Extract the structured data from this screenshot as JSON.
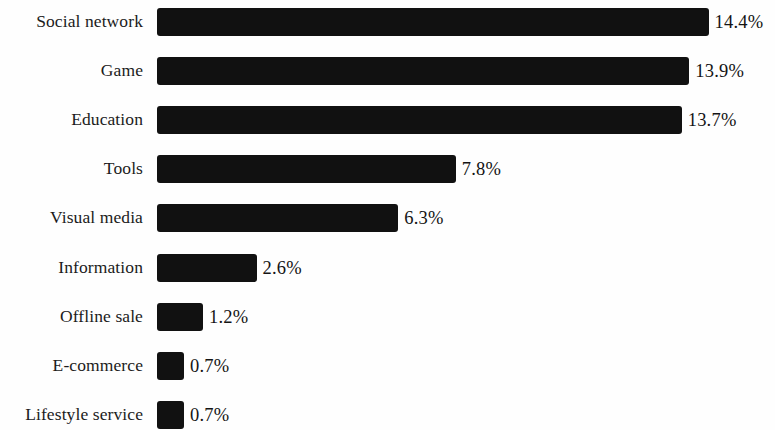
{
  "chart_data": {
    "type": "bar",
    "orientation": "horizontal",
    "title": "",
    "subtitle": "",
    "xlabel": "",
    "ylabel": "",
    "grid": false,
    "legend": false,
    "legend_position": "none",
    "value_suffix": "%",
    "xlim": [
      0,
      14.4
    ],
    "bar_color": "#111111",
    "background_color": "#fefefe",
    "text_color": "#1b1b1b",
    "categories": [
      "Social network",
      "Game",
      "Education",
      "Tools",
      "Visual media",
      "Information",
      "Offline sale",
      "E-commerce",
      "Lifestyle service"
    ],
    "values": [
      14.4,
      13.9,
      13.7,
      7.8,
      6.3,
      2.6,
      1.2,
      0.7,
      0.7
    ],
    "value_labels": [
      "14.4%",
      "13.9%",
      "13.7%",
      "7.8%",
      "6.3%",
      "2.6%",
      "1.2%",
      "0.7%",
      "0.7%"
    ],
    "bars": [
      {
        "category": "Social network",
        "value": 14.4,
        "label": "14.4%"
      },
      {
        "category": "Game",
        "value": 13.9,
        "label": "13.9%"
      },
      {
        "category": "Education",
        "value": 13.7,
        "label": "13.7%"
      },
      {
        "category": "Tools",
        "value": 7.8,
        "label": "7.8%"
      },
      {
        "category": "Visual media",
        "value": 6.3,
        "label": "6.3%"
      },
      {
        "category": "Information",
        "value": 2.6,
        "label": "2.6%"
      },
      {
        "category": "Offline sale",
        "value": 1.2,
        "label": "1.2%"
      },
      {
        "category": "E-commerce",
        "value": 0.7,
        "label": "0.7%"
      },
      {
        "category": "Lifestyle service",
        "value": 0.7,
        "label": "0.7%"
      }
    ]
  },
  "layout": {
    "bar_origin_x": 157,
    "px_per_unit": 38.3,
    "row_spacing": 49.1,
    "first_row_center_y": 22,
    "bar_height": 28,
    "value_label_gap": 6
  }
}
